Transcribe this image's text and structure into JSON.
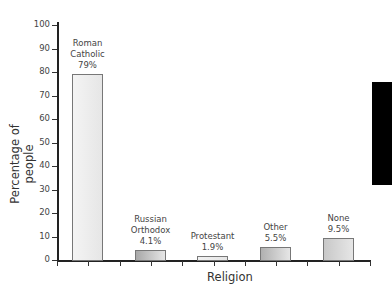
{
  "chart_data": {
    "type": "bar",
    "title": "",
    "xlabel": "Religion",
    "ylabel": "Percentage of people",
    "ylim": [
      0,
      100
    ],
    "yticks": [
      0,
      10,
      20,
      30,
      40,
      50,
      60,
      70,
      80,
      90,
      100
    ],
    "grid": false,
    "categories": [
      "Roman Catholic",
      "Russian Orthodox",
      "Protestant",
      "Other",
      "None"
    ],
    "values": [
      79,
      4.1,
      1.9,
      5.5,
      9.5
    ],
    "data_labels": [
      [
        "Roman",
        "Catholic",
        "79%"
      ],
      [
        "Russian",
        "Orthodox",
        "4.1%"
      ],
      [
        "Protestant",
        "1.9%"
      ],
      [
        "Other",
        "5.5%"
      ],
      [
        "None",
        "9.5%"
      ]
    ],
    "bar_fills": [
      "#f4f4f4",
      "#a8a8a8",
      "#f2f2f2",
      "#b0b0b0",
      "#c8c8c8"
    ]
  },
  "axes": {
    "ylabel": "Percentage of people",
    "xlabel": "Religion",
    "yticks": [
      "0",
      "10",
      "20",
      "30",
      "40",
      "50",
      "60",
      "70",
      "80",
      "90",
      "100"
    ]
  },
  "bars": [
    {
      "line1": "Roman",
      "line2": "Catholic",
      "line3": "79%"
    },
    {
      "line1": "Russian",
      "line2": "Orthodox",
      "line3": "4.1%"
    },
    {
      "line1": "Protestant",
      "line2": "1.9%",
      "line3": ""
    },
    {
      "line1": "Other",
      "line2": "5.5%",
      "line3": ""
    },
    {
      "line1": "None",
      "line2": "9.5%",
      "line3": ""
    }
  ]
}
